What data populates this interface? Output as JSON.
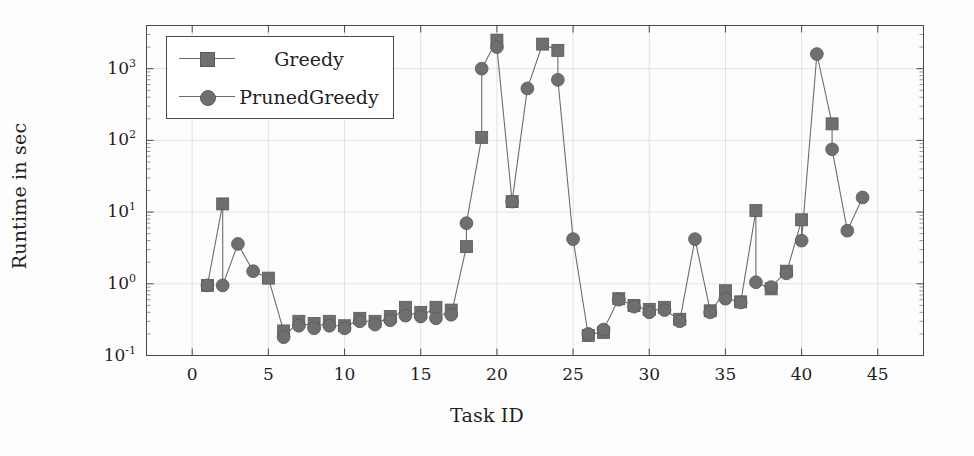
{
  "chart_data": {
    "type": "line",
    "title": "",
    "xlabel": "Task ID",
    "ylabel": "Runtime in sec",
    "xlim": [
      -3,
      48
    ],
    "ylim": [
      0.1,
      4000
    ],
    "yscale": "log",
    "xticks": [
      0,
      5,
      10,
      15,
      20,
      25,
      30,
      35,
      40,
      45
    ],
    "xtick_labels": [
      "0",
      "5",
      "10",
      "15",
      "20",
      "25",
      "30",
      "35",
      "40",
      "45"
    ],
    "yticks": [
      0.1,
      1,
      10,
      100,
      1000
    ],
    "ytick_labels": [
      "10−1",
      "10⁰",
      "10¹",
      "10²",
      "10³"
    ],
    "ytick_mantissa": [
      "10",
      "10",
      "10",
      "10",
      "10"
    ],
    "ytick_exponent": [
      "-1",
      "0",
      "1",
      "2",
      "3"
    ],
    "grid": true,
    "legend_position": "upper left",
    "marker_color": "#6f6f6f",
    "line_color": "#6d6d6d",
    "axis_color": "#4a4a4a",
    "grid_color": "#dcdcdc",
    "series": [
      {
        "name": "Greedy",
        "marker": "square",
        "x": [
          1,
          2,
          5,
          6,
          7,
          8,
          9,
          10,
          11,
          12,
          13,
          14,
          15,
          16,
          17,
          18,
          19,
          20,
          21,
          23,
          24,
          26,
          27,
          28,
          29,
          30,
          31,
          32,
          34,
          35,
          36,
          37,
          38,
          39,
          40,
          42
        ],
        "values": [
          0.95,
          13.0,
          1.2,
          0.22,
          0.3,
          0.28,
          0.3,
          0.26,
          0.33,
          0.3,
          0.35,
          0.47,
          0.4,
          0.47,
          0.43,
          3.3,
          110.0,
          2500.0,
          14.0,
          2200.0,
          1800.0,
          0.19,
          0.21,
          0.62,
          0.5,
          0.44,
          0.47,
          0.32,
          0.42,
          0.8,
          0.56,
          10.5,
          0.85,
          1.5,
          7.8,
          170.0
        ]
      },
      {
        "name": "PrunedGreedy",
        "marker": "circle",
        "x": [
          1,
          2,
          3,
          4,
          6,
          7,
          8,
          9,
          10,
          11,
          12,
          13,
          14,
          15,
          16,
          17,
          18,
          19,
          20,
          21,
          22,
          24,
          25,
          26,
          27,
          28,
          29,
          30,
          31,
          32,
          33,
          34,
          35,
          36,
          37,
          38,
          39,
          40,
          41,
          42,
          43,
          44
        ],
        "values": [
          0.95,
          0.95,
          3.6,
          1.5,
          0.18,
          0.26,
          0.24,
          0.26,
          0.24,
          0.3,
          0.27,
          0.31,
          0.36,
          0.35,
          0.33,
          0.37,
          7.0,
          1000.0,
          2000.0,
          14.0,
          530.0,
          700.0,
          4.2,
          0.2,
          0.23,
          0.6,
          0.48,
          0.4,
          0.43,
          0.3,
          4.2,
          0.4,
          0.62,
          0.55,
          1.05,
          0.9,
          1.4,
          4.0,
          1600.0,
          75.0,
          5.5,
          16.0
        ]
      }
    ]
  },
  "legend": {
    "entries": [
      {
        "label": "Greedy",
        "marker": "square"
      },
      {
        "label": "PrunedGreedy",
        "marker": "circle"
      }
    ]
  }
}
